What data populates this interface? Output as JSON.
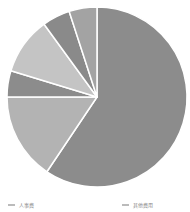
{
  "chart_data": {
    "type": "pie",
    "title": "",
    "start_angle_deg": 0,
    "direction": "clockwise",
    "center": [
      97,
      97
    ],
    "radius": 90,
    "slices": [
      {
        "label": "",
        "value": 59.4,
        "color": "#8c8c8c"
      },
      {
        "label": "",
        "value": 15.6,
        "color": "#b3b3b3"
      },
      {
        "label": "",
        "value": 4.7,
        "color": "#8c8c8c"
      },
      {
        "label": "",
        "value": 10.3,
        "color": "#c4c4c4"
      },
      {
        "label": "",
        "value": 5.0,
        "color": "#8a8a8a"
      },
      {
        "label": "",
        "value": 5.0,
        "color": "#a3a3a3"
      }
    ],
    "legend": {
      "position": "bottom",
      "entries": [
        {
          "label": "人事费"
        },
        {
          "label": "其他费用"
        }
      ]
    }
  }
}
